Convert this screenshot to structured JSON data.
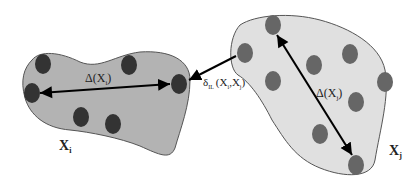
{
  "diagram": {
    "title": "",
    "colors": {
      "cluster_i_fill": "#b3b3b3",
      "cluster_j_fill": "#e0e0e0",
      "outline": "#555555",
      "point_i": "#333333",
      "point_j": "#666666",
      "arrow": "#000000"
    },
    "clusters": [
      {
        "id": "Xi",
        "label_main": "X",
        "label_sub": "i",
        "diameter_label": "Δ(X",
        "diameter_sub": "i",
        "diameter_close": ")"
      },
      {
        "id": "Xj",
        "label_main": "X",
        "label_sub": "j",
        "diameter_label": "Δ(X",
        "diameter_sub": "j",
        "diameter_close": ")"
      }
    ],
    "distance": {
      "symbol": "δ",
      "sub": "IL",
      "args": "(X",
      "arg1_sub": "i",
      "sep": ",X",
      "arg2_sub": "j",
      "close": ")"
    }
  }
}
